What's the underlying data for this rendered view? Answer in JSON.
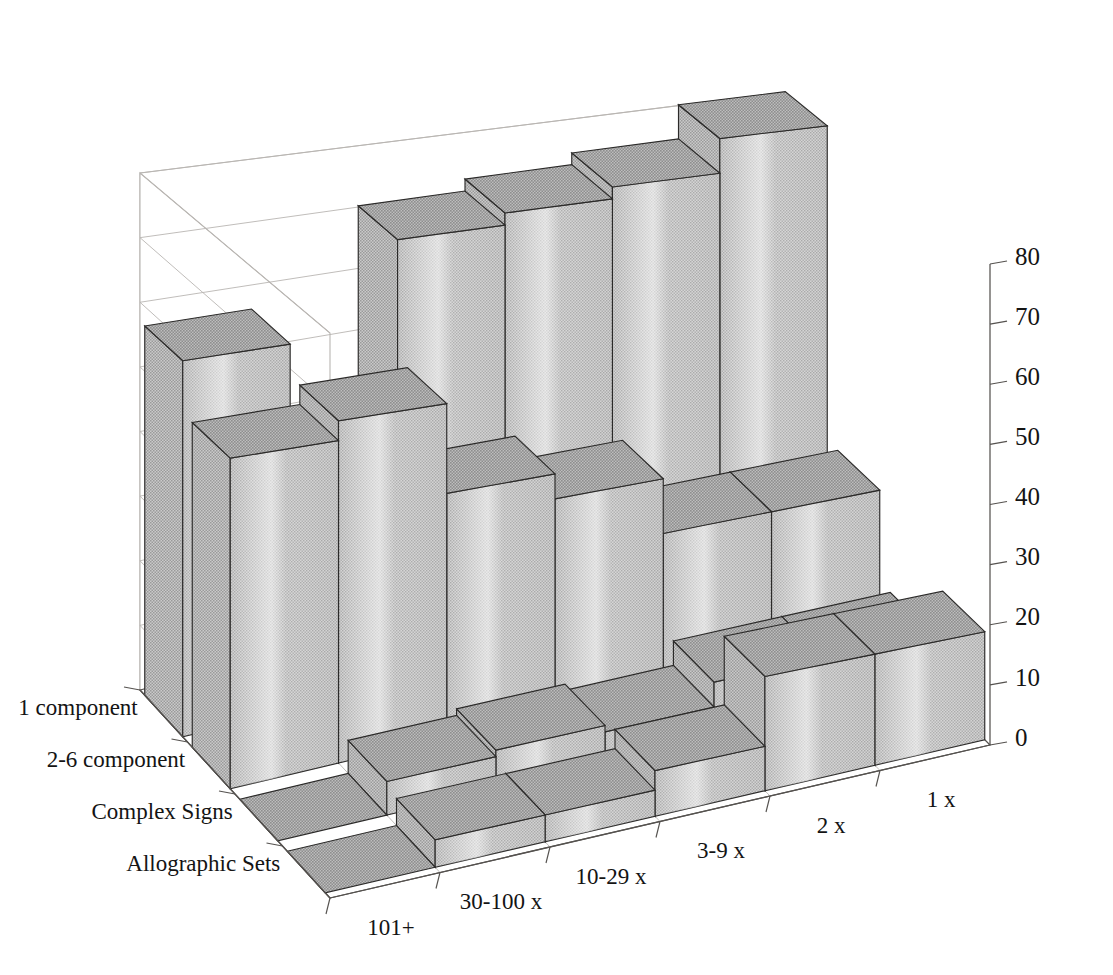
{
  "chart_data": {
    "type": "bar",
    "subtype": "3d-grouped-bar",
    "title": "",
    "subtitle": "",
    "xlabel": "",
    "ylabel": "",
    "zlabel": "",
    "categories": [
      "101+",
      "30-100 x",
      "10-29 x",
      "3-9 x",
      "2 x",
      "1 x"
    ],
    "series_axis_labels": [
      "1 component",
      "2-6 component",
      "Complex Signs",
      "Allographic Sets"
    ],
    "zticks": [
      "0",
      "10",
      "20",
      "30",
      "40",
      "50",
      "60",
      "70",
      "80"
    ],
    "ztick_values": [
      0,
      10,
      20,
      30,
      40,
      50,
      60,
      70,
      80
    ],
    "zlim": [
      0,
      80
    ],
    "grid": true,
    "legend": "none",
    "series": [
      {
        "name": "1 component",
        "values": [
          57,
          0,
          71,
          73,
          75,
          81
        ]
      },
      {
        "name": "2-6 component",
        "values": [
          49,
          52,
          38,
          34,
          25,
          25
        ]
      },
      {
        "name": "Complex Signs",
        "values": [
          0,
          5,
          6,
          5,
          9,
          9
        ]
      },
      {
        "name": "Allographic Sets",
        "values": [
          0,
          4,
          4,
          7,
          18,
          18
        ]
      }
    ]
  },
  "axis": {
    "z_tick_labels": [
      "80",
      "70",
      "60",
      "50",
      "40",
      "30",
      "20",
      "10",
      "0"
    ],
    "x_tick_labels": [
      "101+",
      "30-100 x",
      "10-29 x",
      "3-9 x",
      "2 x",
      "1 x"
    ],
    "y_tick_labels": [
      "1 component",
      "2-6 component",
      "Complex Signs",
      "Allographic Sets"
    ]
  },
  "style": {
    "bar_fill": "#bfbfbf",
    "bar_top_fill": "#a9a9a9",
    "bar_left_fill": "#9e9e9e",
    "bar_outline": "#2b2a29",
    "grid_color": "#b9b6b2",
    "axis_color": "#55524f",
    "background": "#ffffff",
    "text_color": "#141414"
  }
}
